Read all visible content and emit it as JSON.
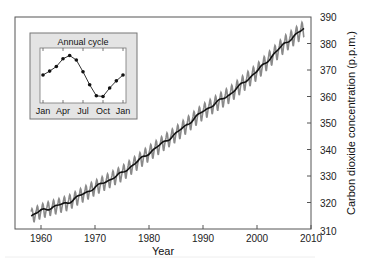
{
  "chart_data": {
    "type": "line",
    "title": "",
    "xlabel": "Year",
    "ylabel": "Carbon dioxide concentration (p.p.m.)",
    "xlim": [
      1955.2,
      2010
    ],
    "ylim": [
      310,
      390
    ],
    "x_ticks": [
      1960,
      1970,
      1980,
      1990,
      2000,
      2010
    ],
    "y_ticks": [
      310,
      320,
      330,
      340,
      350,
      360,
      370,
      380,
      390
    ],
    "y_axis_side": "right",
    "grid": false,
    "legend": null,
    "series": [
      {
        "name": "Monthly CO2 (seasonal)",
        "color": "#8a8a8a",
        "description": "Monthly mean with seasonal oscillation (~6 ppm peak-to-peak)",
        "seasonal_amplitude_ppm": 3.2
      },
      {
        "name": "Deseasonalized trend",
        "color": "#111111",
        "x": [
          1958.2,
          1960,
          1965,
          1970,
          1975,
          1980,
          1985,
          1990,
          1995,
          2000,
          2005,
          2008.7
        ],
        "values": [
          315.0,
          316.9,
          320.0,
          325.7,
          331.1,
          338.7,
          346.0,
          354.4,
          360.9,
          369.5,
          379.8,
          385.6
        ]
      }
    ],
    "inset": {
      "title": "Annual cycle",
      "type": "line",
      "categories": [
        "Jan",
        "Feb",
        "Mar",
        "Apr",
        "May",
        "Jun",
        "Jul",
        "Aug",
        "Sep",
        "Oct",
        "Nov",
        "Dec",
        "Jan"
      ],
      "x_tick_labels": [
        "Jan",
        "Apr",
        "Jul",
        "Oct",
        "Jan"
      ],
      "values": [
        0.0,
        0.6,
        1.3,
        2.5,
        3.0,
        2.3,
        0.5,
        -1.5,
        -3.2,
        -3.3,
        -2.0,
        -0.9,
        0.0
      ],
      "ylabel": "",
      "markers": true
    }
  },
  "labels": {
    "xlabel": "Year",
    "ylabel": "Carbon dioxide concentration (p.p.m.)",
    "inset_title": "Annual cycle"
  },
  "colors": {
    "seasonal_line": "#8a8a8a",
    "trend_line": "#111111",
    "axis": "#555555",
    "inset_bg": "#e4e4e4",
    "inset_plot_bg": "#ffffff"
  }
}
